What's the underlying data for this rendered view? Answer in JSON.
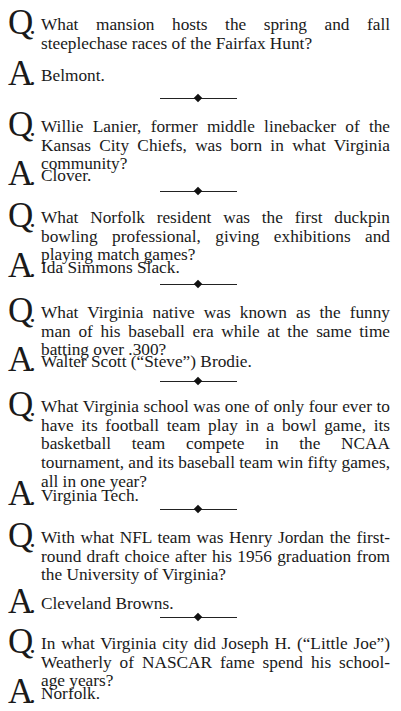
{
  "page": {
    "items": [
      {
        "q_marker": "Q",
        "a_marker": "A",
        "question": "What mansion hosts the spring and fall steeplechase races of the Fairfax Hunt?",
        "answer": "Belmont."
      },
      {
        "q_marker": "Q",
        "a_marker": "A",
        "question": "Willie Lanier, former middle linebacker of the Kansas City Chiefs, was born in what Virginia community?",
        "answer": "Clover."
      },
      {
        "q_marker": "Q",
        "a_marker": "A",
        "question": "What Norfolk resident was the first duckpin bowling pro­fessional, giving exhibitions and playing match games?",
        "answer": "Ida Simmons Slack."
      },
      {
        "q_marker": "Q",
        "a_marker": "A",
        "question": "What Virginia native was known as the funny man of his baseball era while at the same time batting over .300?",
        "answer": "Walter Scott (“Steve”) Brodie."
      },
      {
        "q_marker": "Q",
        "a_marker": "A",
        "question": "What Virginia school was one of only four ever to have its football team play in a bowl game, its basketball team compete in the NCAA tournament, and its baseball team win fifty games, all in one year?",
        "answer": "Virginia Tech."
      },
      {
        "q_marker": "Q",
        "a_marker": "A",
        "question": "With what NFL team was Henry Jordan the first-round draft choice after his 1956 graduation from the Univer­sity of Virginia?",
        "answer": "Cleveland Browns."
      },
      {
        "q_marker": "Q",
        "a_marker": "A",
        "question": "In what Virginia city did Joseph H. (“Little Joe”) Weatherly of NASCAR fame spend his school-age years?",
        "answer": "Norfolk."
      }
    ],
    "divider_icon": "diamond-rule-ornament"
  }
}
